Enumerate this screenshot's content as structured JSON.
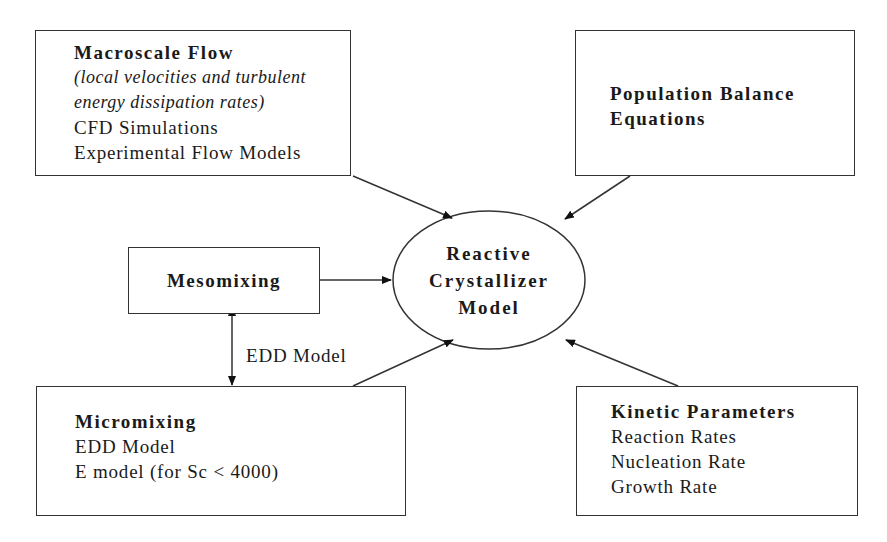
{
  "diagram": {
    "macroscale": {
      "title": "Macroscale Flow",
      "note_line1": "(local velocities and turbulent",
      "note_line2": "energy dissipation rates)",
      "items": [
        "CFD Simulations",
        "Experimental Flow Models"
      ]
    },
    "population": {
      "title_line1": "Population Balance",
      "title_line2": "Equations"
    },
    "mesomixing": {
      "title": "Mesomixing"
    },
    "center": {
      "line1": "Reactive",
      "line2": "Crystallizer",
      "line3": "Model"
    },
    "edge_label": "EDD Model",
    "micromixing": {
      "title": "Micromixing",
      "items": [
        "EDD Model",
        "E model (for Sc < 4000)"
      ]
    },
    "kinetic": {
      "title": "Kinetic Parameters",
      "items": [
        "Reaction Rates",
        "Nucleation Rate",
        "Growth Rate"
      ]
    }
  }
}
